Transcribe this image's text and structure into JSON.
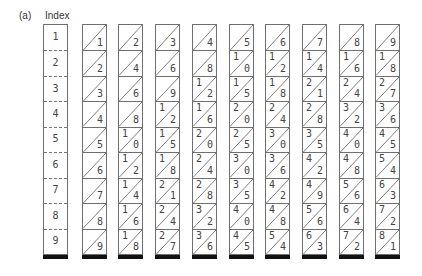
{
  "figure": {
    "panel_label": "(a)",
    "index_title": "Index"
  },
  "index": [
    "1",
    "2",
    "3",
    "4",
    "5",
    "6",
    "7",
    "8",
    "9"
  ],
  "rods": [
    {
      "rod": "1",
      "cells": [
        [
          "",
          "1"
        ],
        [
          "",
          "2"
        ],
        [
          "",
          "3"
        ],
        [
          "",
          "4"
        ],
        [
          "",
          "5"
        ],
        [
          "",
          "6"
        ],
        [
          "",
          "7"
        ],
        [
          "",
          "8"
        ],
        [
          "",
          "9"
        ]
      ]
    },
    {
      "rod": "2",
      "cells": [
        [
          "",
          "2"
        ],
        [
          "",
          "4"
        ],
        [
          "",
          "6"
        ],
        [
          "",
          "8"
        ],
        [
          "1",
          "0"
        ],
        [
          "1",
          "2"
        ],
        [
          "1",
          "4"
        ],
        [
          "1",
          "6"
        ],
        [
          "1",
          "8"
        ]
      ]
    },
    {
      "rod": "3",
      "cells": [
        [
          "",
          "3"
        ],
        [
          "",
          "6"
        ],
        [
          "",
          "9"
        ],
        [
          "1",
          "2"
        ],
        [
          "1",
          "5"
        ],
        [
          "1",
          "8"
        ],
        [
          "2",
          "1"
        ],
        [
          "2",
          "4"
        ],
        [
          "2",
          "7"
        ]
      ]
    },
    {
      "rod": "4",
      "cells": [
        [
          "",
          "4"
        ],
        [
          "",
          "8"
        ],
        [
          "1",
          "2"
        ],
        [
          "1",
          "6"
        ],
        [
          "2",
          "0"
        ],
        [
          "2",
          "4"
        ],
        [
          "2",
          "8"
        ],
        [
          "3",
          "2"
        ],
        [
          "3",
          "6"
        ]
      ]
    },
    {
      "rod": "5",
      "cells": [
        [
          "",
          "5"
        ],
        [
          "1",
          "0"
        ],
        [
          "1",
          "5"
        ],
        [
          "2",
          "0"
        ],
        [
          "2",
          "5"
        ],
        [
          "3",
          "0"
        ],
        [
          "3",
          "5"
        ],
        [
          "4",
          "0"
        ],
        [
          "4",
          "5"
        ]
      ]
    },
    {
      "rod": "6",
      "cells": [
        [
          "",
          "6"
        ],
        [
          "1",
          "2"
        ],
        [
          "1",
          "8"
        ],
        [
          "2",
          "4"
        ],
        [
          "3",
          "0"
        ],
        [
          "3",
          "6"
        ],
        [
          "4",
          "2"
        ],
        [
          "4",
          "8"
        ],
        [
          "5",
          "4"
        ]
      ]
    },
    {
      "rod": "7",
      "cells": [
        [
          "",
          "7"
        ],
        [
          "1",
          "4"
        ],
        [
          "2",
          "1"
        ],
        [
          "2",
          "8"
        ],
        [
          "3",
          "5"
        ],
        [
          "4",
          "2"
        ],
        [
          "4",
          "9"
        ],
        [
          "5",
          "6"
        ],
        [
          "6",
          "3"
        ]
      ]
    },
    {
      "rod": "8",
      "cells": [
        [
          "",
          "8"
        ],
        [
          "1",
          "6"
        ],
        [
          "2",
          "4"
        ],
        [
          "3",
          "2"
        ],
        [
          "4",
          "0"
        ],
        [
          "4",
          "8"
        ],
        [
          "5",
          "6"
        ],
        [
          "6",
          "4"
        ],
        [
          "7",
          "2"
        ]
      ]
    },
    {
      "rod": "9",
      "cells": [
        [
          "",
          "9"
        ],
        [
          "1",
          "8"
        ],
        [
          "2",
          "7"
        ],
        [
          "3",
          "6"
        ],
        [
          "4",
          "5"
        ],
        [
          "5",
          "4"
        ],
        [
          "6",
          "3"
        ],
        [
          "7",
          "2"
        ],
        [
          "8",
          "1"
        ]
      ]
    }
  ],
  "colors": {
    "line": "#6f6f6f",
    "text": "#444444",
    "base_bar": "#111111"
  }
}
